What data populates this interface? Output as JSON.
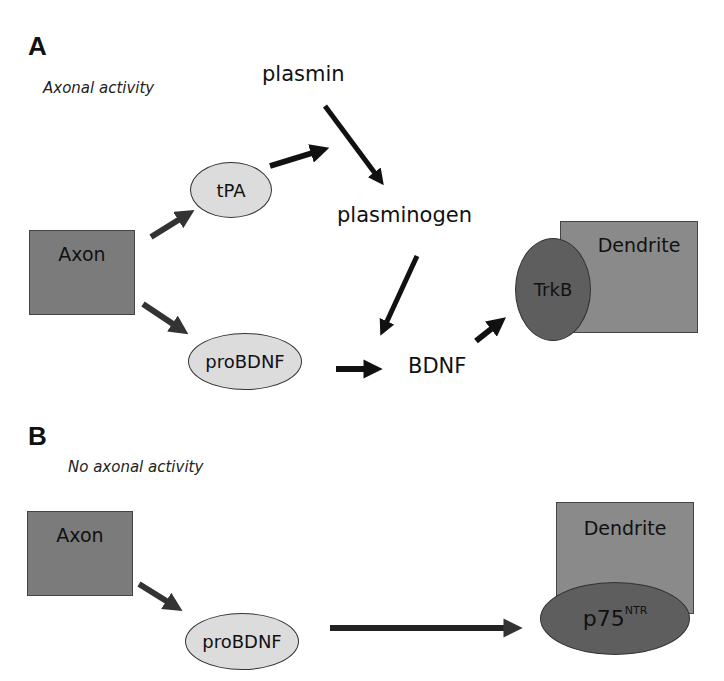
{
  "panel_a": {
    "label": "A",
    "subtitle": "Axonal activity",
    "nodes": {
      "axon": "Axon",
      "tpa": "tPA",
      "plasmin": "plasmin",
      "plasminogen": "plasminogen",
      "probdnf": "proBDNF",
      "bdnf": "BDNF",
      "trkb": "TrkB",
      "dendrite": "Dendrite"
    }
  },
  "panel_b": {
    "label": "B",
    "subtitle": "No axonal activity",
    "nodes": {
      "axon": "Axon",
      "probdnf": "proBDNF",
      "dendrite": "Dendrite",
      "p75_base": "p75",
      "p75_sup": "NTR"
    }
  },
  "colors": {
    "box_fill": "#7b7b7b",
    "light_ellipse": "#dcdcdc",
    "dark_ellipse": "#5e5e5e",
    "arrow": "#111111"
  }
}
